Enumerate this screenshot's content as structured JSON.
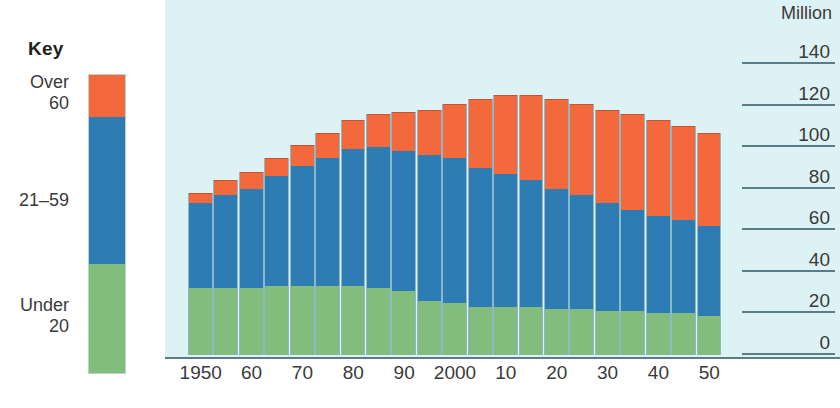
{
  "key": {
    "title": "Key",
    "items": [
      {
        "label": "Over\n60",
        "color": "#f4693c",
        "name": "over-60"
      },
      {
        "label": "21–59",
        "color": "#2d7cb4",
        "name": "21-59"
      },
      {
        "label": "Under\n20",
        "color": "#82bd7e",
        "name": "under-20"
      }
    ]
  },
  "axis": {
    "y_title": "Million",
    "y_ticks": [
      "140",
      "120",
      "100",
      "80",
      "60",
      "40",
      "20",
      "0"
    ],
    "x_ticks": [
      "1950",
      "60",
      "70",
      "80",
      "90",
      "2000",
      "10",
      "20",
      "30",
      "40",
      "50"
    ]
  },
  "colors": {
    "over60": "#f4693c",
    "mid": "#2d7cb4",
    "under20": "#82bd7e",
    "plot_background": "#ddf2f4",
    "axis_line": "#5b7d88",
    "bar_outline": "#8fb8c6",
    "text": "#3a3a3a"
  },
  "chart_data": {
    "type": "bar",
    "title": "",
    "subtitle": "",
    "stacked": true,
    "xlabel": "",
    "ylabel": "Million",
    "ylim": [
      0,
      140
    ],
    "ytick_step": 20,
    "grid": true,
    "legend_position": "left",
    "categories": [
      "1950",
      "1955",
      "1960",
      "1965",
      "1970",
      "1975",
      "1980",
      "1985",
      "1990",
      "1995",
      "2000",
      "2005",
      "2010",
      "2015",
      "2020",
      "2025",
      "2030",
      "2035",
      "2040",
      "2045",
      "2050"
    ],
    "x_tick_labels": [
      "1950",
      "60",
      "70",
      "80",
      "90",
      "2000",
      "10",
      "20",
      "30",
      "40",
      "50"
    ],
    "series": [
      {
        "name": "Under 20",
        "color": "#82bd7e",
        "values": [
          32,
          32,
          32,
          33,
          33,
          33,
          33,
          32,
          31,
          26,
          25,
          23,
          23,
          23,
          22,
          22,
          21,
          21,
          20,
          20,
          19
        ]
      },
      {
        "name": "21–59",
        "color": "#2d7cb4",
        "values": [
          41,
          45,
          48,
          53,
          58,
          62,
          66,
          68,
          67,
          70,
          70,
          67,
          64,
          61,
          58,
          55,
          52,
          49,
          47,
          45,
          43
        ]
      },
      {
        "name": "Over 60",
        "color": "#f4693c",
        "values": [
          5,
          7,
          8,
          9,
          10,
          12,
          14,
          16,
          19,
          22,
          26,
          33,
          38,
          41,
          43,
          44,
          45,
          46,
          46,
          45,
          45
        ]
      }
    ],
    "totals": [
      78,
      84,
      88,
      95,
      101,
      107,
      113,
      116,
      117,
      118,
      121,
      123,
      125,
      125,
      123,
      121,
      118,
      116,
      113,
      110,
      107
    ]
  }
}
